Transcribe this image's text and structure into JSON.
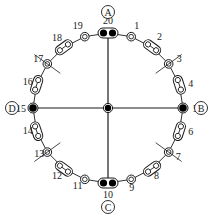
{
  "diagram": {
    "type": "ring-network",
    "center": {
      "x": 108,
      "y": 108
    },
    "radius": 75,
    "colors": {
      "stroke": "#1a1a1a",
      "fill_dark": "#000000",
      "background": "#ffffff"
    },
    "terminals": [
      {
        "id": "A",
        "label": "A",
        "at_node": 20
      },
      {
        "id": "B",
        "label": "B",
        "at_node": 5
      },
      {
        "id": "C",
        "label": "C",
        "at_node": 10
      },
      {
        "id": "D",
        "label": "D",
        "at_node": 15
      }
    ],
    "nodes": [
      {
        "n": 1,
        "label": "1",
        "kind": "ring"
      },
      {
        "n": 2,
        "label": "2",
        "kind": "capsule"
      },
      {
        "n": 3,
        "label": "3",
        "kind": "ring-cross"
      },
      {
        "n": 4,
        "label": "4",
        "kind": "capsule"
      },
      {
        "n": 5,
        "label": "5",
        "kind": "hub"
      },
      {
        "n": 6,
        "label": "6",
        "kind": "capsule"
      },
      {
        "n": 7,
        "label": "7",
        "kind": "ring-cross"
      },
      {
        "n": 8,
        "label": "8",
        "kind": "capsule"
      },
      {
        "n": 9,
        "label": "9",
        "kind": "ring"
      },
      {
        "n": 10,
        "label": "10",
        "kind": "double-hub"
      },
      {
        "n": 11,
        "label": "11",
        "kind": "ring"
      },
      {
        "n": 12,
        "label": "12",
        "kind": "capsule"
      },
      {
        "n": 13,
        "label": "13",
        "kind": "ring-cross"
      },
      {
        "n": 14,
        "label": "14",
        "kind": "capsule"
      },
      {
        "n": 15,
        "label": "15",
        "kind": "hub"
      },
      {
        "n": 16,
        "label": "16",
        "kind": "capsule"
      },
      {
        "n": 17,
        "label": "17",
        "kind": "ring-cross"
      },
      {
        "n": 18,
        "label": "18",
        "kind": "capsule"
      },
      {
        "n": 19,
        "label": "19",
        "kind": "ring"
      },
      {
        "n": 20,
        "label": "20",
        "kind": "double-hub"
      }
    ],
    "center_node": {
      "kind": "hub"
    }
  }
}
